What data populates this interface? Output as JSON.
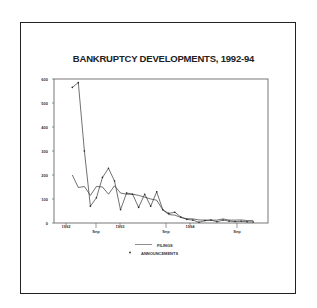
{
  "chart_data": {
    "type": "line",
    "title": "BANKRUPTCY DEVELOPMENTS, 1992-94",
    "xlabel": "",
    "ylabel": "",
    "ylim": [
      0,
      600
    ],
    "yticks": [
      0,
      100,
      200,
      300,
      400,
      500,
      600
    ],
    "xtick_labels": [
      "1992",
      "Sep",
      "1993",
      "Sep",
      "1994",
      "Sep"
    ],
    "grid": false,
    "legend_position": "bottom",
    "x": [
      1,
      2,
      3,
      4,
      5,
      6,
      7,
      8,
      9,
      10,
      11,
      12,
      13,
      14,
      15,
      16,
      17,
      18,
      19,
      20,
      21,
      22,
      23,
      24,
      25,
      26,
      27,
      28,
      29,
      30,
      31
    ],
    "series": [
      {
        "name": "FILINGS",
        "style": "line",
        "values": [
          200,
          148,
          152,
          115,
          152,
          150,
          120,
          155,
          125,
          120,
          120,
          115,
          108,
          100,
          95,
          55,
          35,
          33,
          23,
          18,
          17,
          13,
          12,
          12,
          12,
          17,
          12,
          12,
          13,
          10,
          10
        ]
      },
      {
        "name": "ANNOUNCEMENTS",
        "style": "line-with-markers",
        "values": [
          565,
          585,
          300,
          70,
          105,
          190,
          228,
          175,
          55,
          125,
          120,
          65,
          120,
          70,
          130,
          55,
          40,
          45,
          25,
          15,
          12,
          3,
          10,
          12,
          5,
          12,
          8,
          6,
          7,
          5,
          4
        ]
      }
    ]
  },
  "legend": {
    "filings": "FILINGS",
    "announcements": "ANNOUNCEMENTS"
  }
}
